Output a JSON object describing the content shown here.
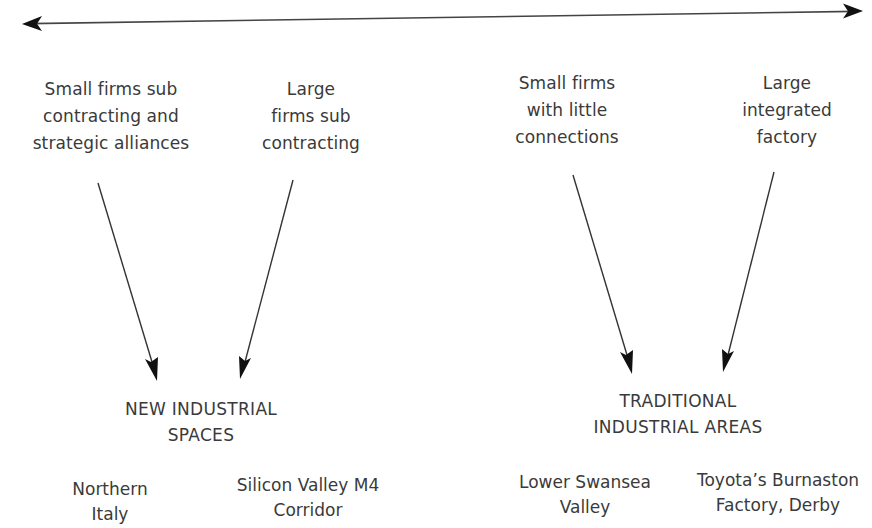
{
  "diagram": {
    "type": "spectrum-flow",
    "spectrum_arrow": {
      "direction": "bidirectional",
      "from": [
        22,
        24
      ],
      "to": [
        863,
        11
      ]
    },
    "sources": [
      {
        "id": "small-firms-subcontracting",
        "lines": [
          "Small firms sub",
          "contracting and",
          "strategic alliances"
        ]
      },
      {
        "id": "large-firms-subcontracting",
        "lines": [
          "Large",
          "firms sub",
          "contracting"
        ]
      },
      {
        "id": "small-firms-little-connections",
        "lines": [
          "Small firms",
          "with little",
          "connections"
        ]
      },
      {
        "id": "large-integrated-factory",
        "lines": [
          "Large",
          "integrated",
          "factory"
        ]
      }
    ],
    "categories": [
      {
        "id": "new-industrial-spaces",
        "lines": [
          "NEW INDUSTRIAL",
          "SPACES"
        ]
      },
      {
        "id": "traditional-industrial-areas",
        "lines": [
          "TRADITIONAL",
          "INDUSTRIAL AREAS"
        ]
      }
    ],
    "examples": [
      {
        "id": "northern-italy",
        "lines": [
          "Northern",
          "Italy"
        ]
      },
      {
        "id": "silicon-valley-m4",
        "lines": [
          "Silicon Valley M4",
          "Corridor"
        ]
      },
      {
        "id": "lower-swansea-valley",
        "lines": [
          "Lower Swansea",
          "Valley"
        ]
      },
      {
        "id": "toyota-burnaston",
        "lines": [
          "Toyota’s Burnaston",
          "Factory, Derby"
        ]
      }
    ],
    "edges": [
      {
        "from": "small-firms-subcontracting",
        "to": "new-industrial-spaces"
      },
      {
        "from": "large-firms-subcontracting",
        "to": "new-industrial-spaces"
      },
      {
        "from": "small-firms-little-connections",
        "to": "traditional-industrial-areas"
      },
      {
        "from": "large-integrated-factory",
        "to": "traditional-industrial-areas"
      }
    ],
    "colors": {
      "text": "#3a3a3a",
      "arrow": "#1a1a1a",
      "background": "#ffffff"
    }
  }
}
